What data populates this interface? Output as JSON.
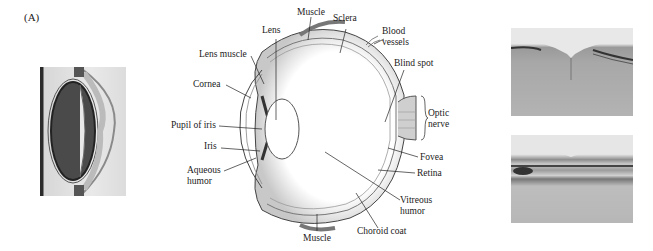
{
  "figure": {
    "panel_label": "(A)",
    "photos": {
      "left": "eye-cross-section-photo",
      "right_top": "retina-fovea-micrograph-top",
      "right_bottom": "retina-fovea-micrograph-bottom"
    },
    "diagram_labels": {
      "lens": "Lens",
      "muscle_top": "Muscle",
      "sclera": "Sclera",
      "blood_vessels_1": "Blood",
      "blood_vessels_2": "vessels",
      "lens_muscle": "Lens muscle",
      "cornea": "Cornea",
      "blind_spot": "Blind spot",
      "optic_nerve_1": "Optic",
      "optic_nerve_2": "nerve",
      "pupil_of_iris": "Pupil of iris",
      "iris": "Iris",
      "aqueous_humor_1": "Aqueous",
      "aqueous_humor_2": "humor",
      "fovea": "Fovea",
      "retina": "Retina",
      "vitreous_humor_1": "Vitreous",
      "vitreous_humor_2": "humor",
      "choroid_coat": "Choroid coat",
      "muscle_bottom": "Muscle"
    }
  }
}
